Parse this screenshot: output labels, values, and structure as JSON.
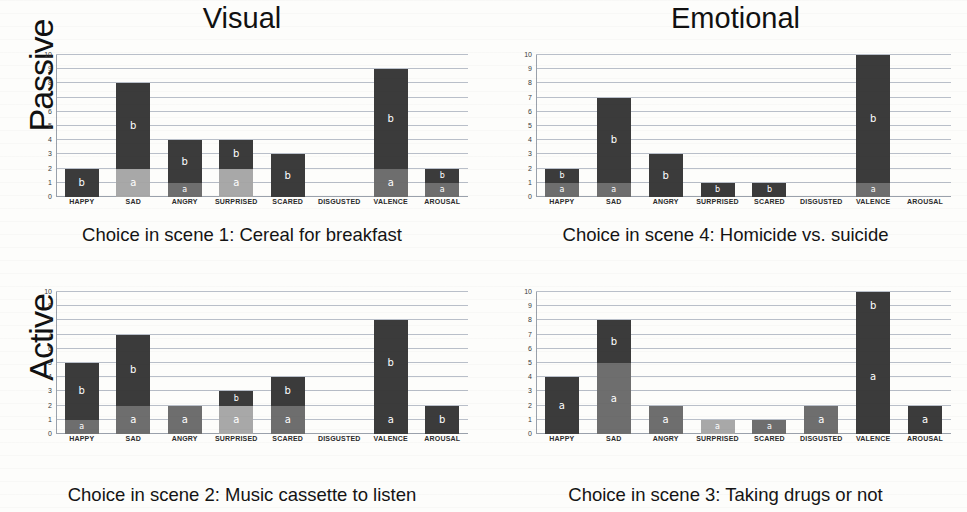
{
  "column_titles": [
    "Visual",
    "Emotional"
  ],
  "row_labels": [
    "Passive",
    "Active"
  ],
  "axis": {
    "y_ticks": [
      "10",
      "9",
      "8",
      "7",
      "6",
      "5",
      "4",
      "3",
      "2",
      "1",
      "0"
    ],
    "y_min": 0,
    "y_max": 10,
    "categories": [
      "HAPPY",
      "SAD",
      "ANGRY",
      "SURPRISED",
      "SCARED",
      "DISGUSTED",
      "VALENCE",
      "AROUSAL"
    ]
  },
  "colors": {
    "dark": "#3b3b3b",
    "mid": "#6e6e6e",
    "light": "#a8a8a8",
    "gridline": "#b9bfc9",
    "background": "#fdfdfb",
    "label_text": "#ffffff"
  },
  "chart_data": [
    {
      "type": "bar",
      "id": "visual-passive",
      "title": "Choice in scene 1: Cereal for breakfast",
      "column": "Visual",
      "row": "Passive",
      "xlabel": "",
      "ylabel": "",
      "ylim": [
        0,
        10
      ],
      "grid": true,
      "categories": [
        "HAPPY",
        "SAD",
        "ANGRY",
        "SURPRISED",
        "SCARED",
        "DISGUSTED",
        "VALENCE",
        "AROUSAL"
      ],
      "values": [
        2,
        8,
        4,
        4,
        3,
        0,
        9,
        2
      ],
      "stacks": [
        [
          {
            "label": "b",
            "from": 0,
            "to": 2,
            "shade": "dark"
          }
        ],
        [
          {
            "label": "a",
            "from": 0,
            "to": 2,
            "shade": "light"
          },
          {
            "label": "b",
            "from": 2,
            "to": 8,
            "shade": "dark"
          }
        ],
        [
          {
            "label": "a",
            "from": 0,
            "to": 1,
            "shade": "mid"
          },
          {
            "label": "b",
            "from": 1,
            "to": 4,
            "shade": "dark"
          }
        ],
        [
          {
            "label": "a",
            "from": 0,
            "to": 2,
            "shade": "light"
          },
          {
            "label": "b",
            "from": 2,
            "to": 4,
            "shade": "dark"
          }
        ],
        [
          {
            "label": "b",
            "from": 0,
            "to": 3,
            "shade": "dark"
          }
        ],
        [],
        [
          {
            "label": "a",
            "from": 0,
            "to": 2,
            "shade": "mid"
          },
          {
            "label": "b",
            "from": 2,
            "to": 9,
            "shade": "dark"
          }
        ],
        [
          {
            "label": "a",
            "from": 0,
            "to": 1,
            "shade": "mid"
          },
          {
            "label": "b",
            "from": 1,
            "to": 2,
            "shade": "dark"
          }
        ]
      ]
    },
    {
      "type": "bar",
      "id": "emotional-passive",
      "title": "Choice in scene 4: Homicide vs. suicide",
      "column": "Emotional",
      "row": "Passive",
      "xlabel": "",
      "ylabel": "",
      "ylim": [
        0,
        10
      ],
      "grid": true,
      "categories": [
        "HAPPY",
        "SAD",
        "ANGRY",
        "SURPRISED",
        "SCARED",
        "DISGUSTED",
        "VALENCE",
        "AROUSAL"
      ],
      "values": [
        2,
        7,
        3,
        1,
        1,
        0,
        10,
        0
      ],
      "stacks": [
        [
          {
            "label": "a",
            "from": 0,
            "to": 1,
            "shade": "mid"
          },
          {
            "label": "b",
            "from": 1,
            "to": 2,
            "shade": "dark"
          }
        ],
        [
          {
            "label": "a",
            "from": 0,
            "to": 1,
            "shade": "mid"
          },
          {
            "label": "b",
            "from": 1,
            "to": 7,
            "shade": "dark"
          }
        ],
        [
          {
            "label": "b",
            "from": 0,
            "to": 3,
            "shade": "dark"
          }
        ],
        [
          {
            "label": "b",
            "from": 0,
            "to": 1,
            "shade": "dark"
          }
        ],
        [
          {
            "label": "b",
            "from": 0,
            "to": 1,
            "shade": "dark"
          }
        ],
        [],
        [
          {
            "label": "a",
            "from": 0,
            "to": 1,
            "shade": "mid"
          },
          {
            "label": "b",
            "from": 1,
            "to": 10,
            "shade": "dark"
          }
        ],
        []
      ]
    },
    {
      "type": "bar",
      "id": "visual-active",
      "title": "Choice in scene 2: Music cassette to listen",
      "column": "Visual",
      "row": "Active",
      "xlabel": "",
      "ylabel": "",
      "ylim": [
        0,
        10
      ],
      "grid": true,
      "categories": [
        "HAPPY",
        "SAD",
        "ANGRY",
        "SURPRISED",
        "SCARED",
        "DISGUSTED",
        "VALENCE",
        "AROUSAL"
      ],
      "values": [
        5,
        7,
        2,
        3,
        4,
        0,
        8,
        2
      ],
      "stacks": [
        [
          {
            "label": "a",
            "from": 0,
            "to": 1,
            "shade": "mid"
          },
          {
            "label": "b",
            "from": 1,
            "to": 5,
            "shade": "dark"
          }
        ],
        [
          {
            "label": "a",
            "from": 0,
            "to": 2,
            "shade": "mid"
          },
          {
            "label": "b",
            "from": 2,
            "to": 7,
            "shade": "dark"
          }
        ],
        [
          {
            "label": "a",
            "from": 0,
            "to": 2,
            "shade": "mid"
          }
        ],
        [
          {
            "label": "a",
            "from": 0,
            "to": 2,
            "shade": "light"
          },
          {
            "label": "b",
            "from": 2,
            "to": 3,
            "shade": "dark"
          }
        ],
        [
          {
            "label": "a",
            "from": 0,
            "to": 2,
            "shade": "mid"
          },
          {
            "label": "b",
            "from": 2,
            "to": 4,
            "shade": "dark"
          }
        ],
        [],
        [
          {
            "label": "a",
            "from": 0,
            "to": 2,
            "shade": "dark"
          },
          {
            "label": "b",
            "from": 2,
            "to": 8,
            "shade": "dark"
          }
        ],
        [
          {
            "label": "b",
            "from": 0,
            "to": 2,
            "shade": "dark"
          }
        ]
      ]
    },
    {
      "type": "bar",
      "id": "emotional-active",
      "title": "Choice in scene 3: Taking drugs or not",
      "column": "Emotional",
      "row": "Active",
      "xlabel": "",
      "ylabel": "",
      "ylim": [
        0,
        10
      ],
      "grid": true,
      "categories": [
        "HAPPY",
        "SAD",
        "ANGRY",
        "SURPRISED",
        "SCARED",
        "DISGUSTED",
        "VALENCE",
        "AROUSAL"
      ],
      "values": [
        4,
        8,
        2,
        1,
        1,
        2,
        10,
        2
      ],
      "stacks": [
        [
          {
            "label": "a",
            "from": 0,
            "to": 4,
            "shade": "dark"
          }
        ],
        [
          {
            "label": "a",
            "from": 0,
            "to": 5,
            "shade": "mid"
          },
          {
            "label": "b",
            "from": 5,
            "to": 8,
            "shade": "dark"
          }
        ],
        [
          {
            "label": "a",
            "from": 0,
            "to": 2,
            "shade": "mid"
          }
        ],
        [
          {
            "label": "a",
            "from": 0,
            "to": 1,
            "shade": "light"
          }
        ],
        [
          {
            "label": "a",
            "from": 0,
            "to": 1,
            "shade": "mid"
          }
        ],
        [
          {
            "label": "a",
            "from": 0,
            "to": 2,
            "shade": "mid"
          }
        ],
        [
          {
            "label": "a",
            "from": 0,
            "to": 8,
            "shade": "dark"
          },
          {
            "label": "b",
            "from": 8,
            "to": 10,
            "shade": "dark"
          }
        ],
        [
          {
            "label": "a",
            "from": 0,
            "to": 2,
            "shade": "dark"
          }
        ]
      ]
    }
  ]
}
